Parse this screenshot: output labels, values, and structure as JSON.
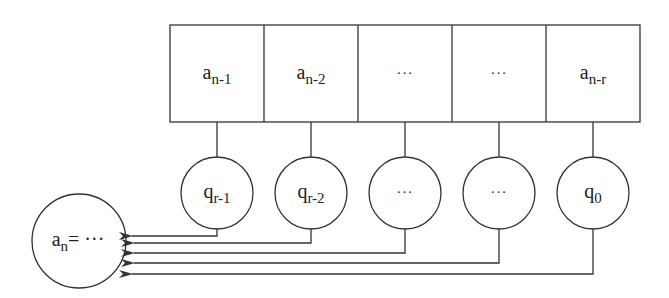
{
  "diagram": {
    "type": "linear-recurrence-register",
    "registers": [
      {
        "base": "a",
        "sub": "n-1"
      },
      {
        "base": "a",
        "sub": "n-2"
      },
      {
        "base": "···",
        "sub": ""
      },
      {
        "base": "···",
        "sub": ""
      },
      {
        "base": "a",
        "sub": "n-r"
      }
    ],
    "coefficients": [
      {
        "base": "q",
        "sub": "r-1"
      },
      {
        "base": "q",
        "sub": "r-2"
      },
      {
        "base": "···",
        "sub": ""
      },
      {
        "base": "···",
        "sub": ""
      },
      {
        "base": "q",
        "sub": "0"
      }
    ],
    "output": {
      "base": "a",
      "sub": "n",
      "rest": "= ···"
    },
    "colors": {
      "stroke": "#333333",
      "background": "#ffffff"
    }
  }
}
